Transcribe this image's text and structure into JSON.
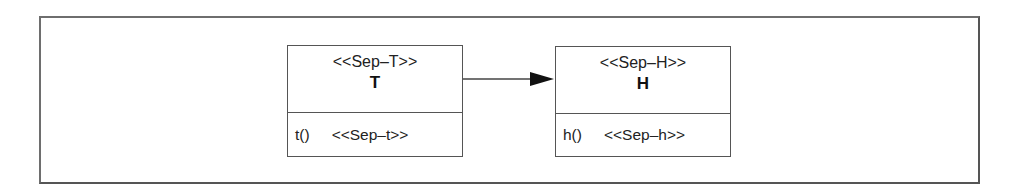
{
  "diagram": {
    "type": "uml-class",
    "classes": [
      {
        "id": "T",
        "stereotype": "<<Sep–T>>",
        "name": "T",
        "operation": "t()",
        "operation_stereotype": "<<Sep–t>>"
      },
      {
        "id": "H",
        "stereotype": "<<Sep–H>>",
        "name": "H",
        "operation": "h()",
        "operation_stereotype": "<<Sep–h>>"
      }
    ],
    "relations": [
      {
        "from": "T",
        "to": "H",
        "kind": "directed-association"
      }
    ]
  }
}
